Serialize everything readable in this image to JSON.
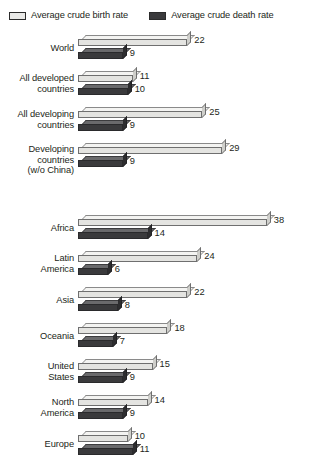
{
  "legend": {
    "items": [
      {
        "label": "Average crude birth rate",
        "swatch": "light-swatch-icon",
        "color": "#e9e9e7"
      },
      {
        "label": "Average crude death rate",
        "swatch": "dark-swatch-icon",
        "color": "#3a3a3c"
      }
    ]
  },
  "chart_data": {
    "type": "bar",
    "orientation": "horizontal",
    "title": "",
    "xlabel": "",
    "ylabel": "",
    "xlim": [
      0,
      38
    ],
    "grid": false,
    "legend_position": "top-left",
    "units": "per 1,000 population",
    "series": [
      {
        "name": "Average crude birth rate",
        "color": "#e4e4e1",
        "values": [
          22,
          11,
          25,
          29,
          38,
          24,
          22,
          18,
          15,
          14,
          10
        ]
      },
      {
        "name": "Average crude death rate",
        "color": "#3a3a3c",
        "values": [
          9,
          10,
          9,
          9,
          14,
          6,
          8,
          7,
          9,
          9,
          11
        ]
      }
    ],
    "categories": [
      "World",
      "All developed countries",
      "All developing countries",
      "Developing countries (w/o China)",
      "Africa",
      "Latin America",
      "Asia",
      "Oceania",
      "United States",
      "North America",
      "Europe"
    ],
    "groups": [
      {
        "name": "aggregate-group",
        "rows": [
          {
            "label": [
              "World"
            ],
            "birth": 22,
            "death": 9
          },
          {
            "label": [
              "All developed",
              "countries"
            ],
            "birth": 11,
            "death": 10
          },
          {
            "label": [
              "All developing",
              "countries"
            ],
            "birth": 25,
            "death": 9
          },
          {
            "label": [
              "Developing",
              "countries",
              "(w/o China)"
            ],
            "birth": 29,
            "death": 9
          }
        ]
      },
      {
        "name": "region-group",
        "rows": [
          {
            "label": [
              "Africa"
            ],
            "birth": 38,
            "death": 14
          },
          {
            "label": [
              "Latin",
              "America"
            ],
            "birth": 24,
            "death": 6
          },
          {
            "label": [
              "Asia"
            ],
            "birth": 22,
            "death": 8
          },
          {
            "label": [
              "Oceania"
            ],
            "birth": 18,
            "death": 7
          },
          {
            "label": [
              "United",
              "States"
            ],
            "birth": 15,
            "death": 9
          },
          {
            "label": [
              "North",
              "America"
            ],
            "birth": 14,
            "death": 9
          },
          {
            "label": [
              "Europe"
            ],
            "birth": 10,
            "death": 11
          }
        ]
      }
    ]
  }
}
